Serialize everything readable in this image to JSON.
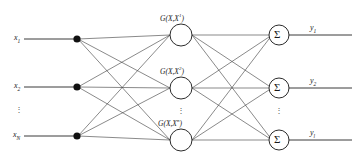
{
  "figure": {
    "type": "rbf-neural-network-diagram",
    "width": 360,
    "height": 161,
    "background": "#ffffff",
    "line_color": "#3a3a3a",
    "node_fill": "#ffffff",
    "node_stroke": "#2b2b2b",
    "fanout_dot_color": "#111111"
  },
  "input_layer": {
    "name": "input-layer",
    "nodes": [
      {
        "id": "x1",
        "label": "x",
        "subscript": "1"
      },
      {
        "id": "x2",
        "label": "x",
        "subscript": "2"
      },
      {
        "id": "xN",
        "label": "x",
        "subscript": "N"
      }
    ],
    "ellipsis": "⋮"
  },
  "hidden_layer": {
    "name": "hidden-layer",
    "nodes": [
      {
        "id": "h1",
        "label": "G(X,X",
        "superscript": "1",
        "close": ")"
      },
      {
        "id": "h2",
        "label": "G(X,X",
        "superscript": "2",
        "close": ")"
      },
      {
        "id": "hn",
        "label": "G(X,X",
        "superscript": "n",
        "close": ")"
      }
    ],
    "ellipsis": "⋮"
  },
  "output_layer": {
    "name": "output-layer",
    "node_glyph": "Σ",
    "nodes": [
      {
        "id": "y1",
        "label": "y",
        "subscript": "1"
      },
      {
        "id": "y2",
        "label": "y",
        "subscript": "2"
      },
      {
        "id": "yl",
        "label": "y",
        "subscript": "l"
      }
    ],
    "ellipsis": "⋮"
  }
}
